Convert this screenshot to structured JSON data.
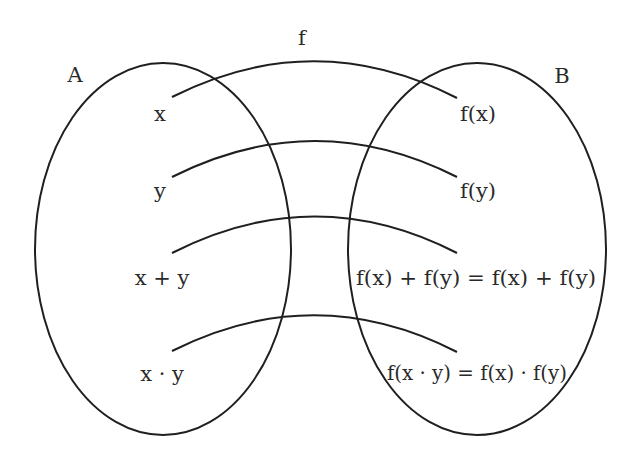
{
  "diagram": {
    "function_label": "f",
    "sets": [
      {
        "name": "A"
      },
      {
        "name": "B"
      }
    ],
    "domain_elements": [
      "x",
      "y",
      "x + y",
      "x · y"
    ],
    "codomain_elements": [
      "f(x)",
      "f(y)",
      "f(x) + f(y) = f(x) + f(y)",
      "f(x · y) = f(x) · f(y)"
    ],
    "mappings": [
      {
        "from": "x",
        "to": "f(x)"
      },
      {
        "from": "y",
        "to": "f(y)"
      },
      {
        "from": "x + y",
        "to": "f(x) + f(y) = f(x) + f(y)"
      },
      {
        "from": "x · y",
        "to": "f(x · y) = f(x) · f(y)"
      }
    ],
    "colors": {
      "stroke": "#1f1f1f",
      "text": "#2a2a2a",
      "background": "#ffffff"
    }
  }
}
